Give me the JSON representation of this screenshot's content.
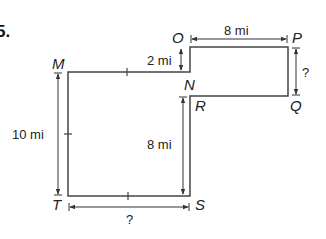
{
  "problem": {
    "number": "5."
  },
  "vertices": {
    "M": "M",
    "N": "N",
    "O": "O",
    "P": "P",
    "Q": "Q",
    "R": "R",
    "S": "S",
    "T": "T"
  },
  "dimensions": {
    "OP": "8 mi",
    "ON": "2 mi",
    "PQ": "?",
    "MT": "10 mi",
    "RS": "8 mi",
    "TS": "?"
  },
  "colors": {
    "line": "#333333",
    "background": "#ffffff"
  }
}
